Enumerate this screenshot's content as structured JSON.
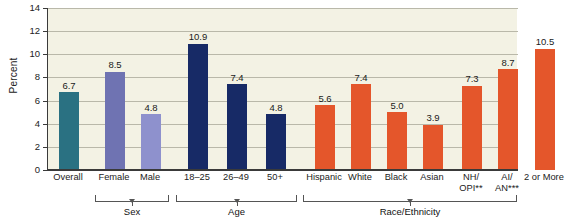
{
  "chart_data": {
    "type": "bar",
    "title": "",
    "xlabel": "",
    "ylabel": "Percent",
    "ylim": [
      0,
      14
    ],
    "ytick_values": [
      0,
      2,
      4,
      6,
      8,
      10,
      12,
      14
    ],
    "ytick_labels": [
      "0",
      "2",
      "4",
      "6",
      "8",
      "10",
      "12",
      "14"
    ],
    "grid": "horizontal",
    "legend": "none",
    "categories": [
      "Overall",
      "Female",
      "Male",
      "18–25",
      "26–49",
      "50+",
      "Hispanic",
      "White",
      "Black",
      "Asian",
      "NH/OPI**",
      "AI/AN***",
      "2 or More"
    ],
    "values": [
      6.7,
      8.5,
      4.8,
      10.9,
      7.4,
      4.8,
      5.6,
      7.4,
      5.0,
      3.9,
      7.3,
      8.7,
      10.5
    ],
    "value_labels": [
      "6.7",
      "8.5",
      "4.8",
      "10.9",
      "7.4",
      "4.8",
      "5.6",
      "7.4",
      "5.0",
      "3.9",
      "7.3",
      "8.7",
      "10.5"
    ],
    "bar_colors": [
      "#2a7182",
      "#6f73b2",
      "#8e91cd",
      "#172a66",
      "#172a66",
      "#172a66",
      "#e4562b",
      "#e4562b",
      "#e4562b",
      "#e4562b",
      "#e4562b",
      "#e4562b",
      "#e4562b"
    ],
    "groups": [
      {
        "label": "",
        "categories": [
          "Overall"
        ]
      },
      {
        "label": "Sex",
        "categories": [
          "Female",
          "Male"
        ]
      },
      {
        "label": "Age",
        "categories": [
          "18–25",
          "26–49",
          "50+"
        ]
      },
      {
        "label": "Race/Ethnicity",
        "categories": [
          "Hispanic",
          "White",
          "Black",
          "Asian",
          "NH/OPI**",
          "AI/AN***",
          "2 or More"
        ]
      }
    ],
    "plot_background": "#f3f2e4",
    "axis_color": "#3a3a3a",
    "gridline_color": "#b9b8a9"
  },
  "bars": [
    {
      "name": "overall",
      "label_line1": "Overall",
      "label_line2": "",
      "value": 6.7,
      "value_label": "6.7",
      "color": "#2a7182"
    },
    {
      "name": "female",
      "label_line1": "Female",
      "label_line2": "",
      "value": 8.5,
      "value_label": "8.5",
      "color": "#6f73b2"
    },
    {
      "name": "male",
      "label_line1": "Male",
      "label_line2": "",
      "value": 4.8,
      "value_label": "4.8",
      "color": "#8e91cd"
    },
    {
      "name": "age-18-25",
      "label_line1": "18–25",
      "label_line2": "",
      "value": 10.9,
      "value_label": "10.9",
      "color": "#172a66"
    },
    {
      "name": "age-26-49",
      "label_line1": "26–49",
      "label_line2": "",
      "value": 7.4,
      "value_label": "7.4",
      "color": "#172a66"
    },
    {
      "name": "age-50plus",
      "label_line1": "50+",
      "label_line2": "",
      "value": 4.8,
      "value_label": "4.8",
      "color": "#172a66"
    },
    {
      "name": "hispanic",
      "label_line1": "Hispanic",
      "label_line2": "",
      "value": 5.6,
      "value_label": "5.6",
      "color": "#e4562b"
    },
    {
      "name": "white",
      "label_line1": "White",
      "label_line2": "",
      "value": 7.4,
      "value_label": "7.4",
      "color": "#e4562b"
    },
    {
      "name": "black",
      "label_line1": "Black",
      "label_line2": "",
      "value": 5.0,
      "value_label": "5.0",
      "color": "#e4562b"
    },
    {
      "name": "asian",
      "label_line1": "Asian",
      "label_line2": "",
      "value": 3.9,
      "value_label": "3.9",
      "color": "#e4562b"
    },
    {
      "name": "nhopi",
      "label_line1": "NH/",
      "label_line2": "OPI**",
      "value": 7.3,
      "value_label": "7.3",
      "color": "#e4562b"
    },
    {
      "name": "aian",
      "label_line1": "AI/",
      "label_line2": "AN***",
      "value": 8.7,
      "value_label": "8.7",
      "color": "#e4562b"
    },
    {
      "name": "two-or-more",
      "label_line1": "2 or More",
      "label_line2": "",
      "value": 10.5,
      "value_label": "10.5",
      "color": "#e4562b"
    }
  ],
  "axis": {
    "y_title": "Percent",
    "y_ticks": [
      "14",
      "12",
      "10",
      "8",
      "6",
      "4",
      "2",
      "0"
    ]
  },
  "group_labels": {
    "sex": "Sex",
    "age": "Age",
    "race": "Race/Ethnicity"
  }
}
